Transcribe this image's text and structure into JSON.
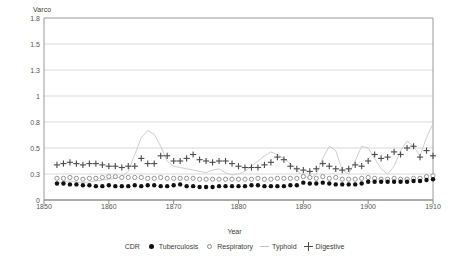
{
  "chart_data": {
    "type": "scatter",
    "title": "",
    "ylabel": "Varco",
    "xlabel": "Year",
    "xlim": [
      1850,
      1910
    ],
    "ylim": [
      0,
      1.8
    ],
    "grid": true,
    "legend_position": "bottom",
    "ytick_labels": [
      "1.8",
      "1.5",
      "1.3",
      "1",
      "0.8",
      "0.5",
      "0.3",
      "0"
    ],
    "ytick_values": [
      1.8,
      1.5,
      1.3,
      1.0,
      0.8,
      0.5,
      0.3,
      0.0
    ],
    "xtick_labels": [
      "1850",
      "1860",
      "1870",
      "1880",
      "1890",
      "1900",
      "1910"
    ],
    "xtick_values": [
      1850,
      1860,
      1870,
      1880,
      1890,
      1900,
      1910
    ],
    "legend_prefix": "CDR",
    "series": [
      {
        "name": "Tuberculosis",
        "marker": "filled-circle",
        "color": "#111111",
        "x": [
          1852,
          1853,
          1854,
          1855,
          1856,
          1857,
          1858,
          1859,
          1860,
          1861,
          1862,
          1863,
          1864,
          1865,
          1866,
          1867,
          1868,
          1869,
          1870,
          1871,
          1872,
          1873,
          1874,
          1875,
          1876,
          1877,
          1878,
          1879,
          1880,
          1881,
          1882,
          1883,
          1884,
          1885,
          1886,
          1887,
          1888,
          1889,
          1890,
          1891,
          1892,
          1893,
          1894,
          1895,
          1896,
          1897,
          1898,
          1899,
          1900,
          1901,
          1902,
          1903,
          1904,
          1905,
          1906,
          1907,
          1908,
          1909,
          1910
        ],
        "values": [
          0.19,
          0.19,
          0.18,
          0.18,
          0.17,
          0.17,
          0.16,
          0.16,
          0.17,
          0.16,
          0.16,
          0.16,
          0.17,
          0.16,
          0.17,
          0.17,
          0.16,
          0.16,
          0.17,
          0.18,
          0.16,
          0.16,
          0.15,
          0.15,
          0.15,
          0.16,
          0.16,
          0.16,
          0.16,
          0.16,
          0.17,
          0.17,
          0.16,
          0.16,
          0.16,
          0.16,
          0.17,
          0.17,
          0.2,
          0.19,
          0.19,
          0.2,
          0.19,
          0.18,
          0.18,
          0.18,
          0.18,
          0.19,
          0.21,
          0.21,
          0.21,
          0.21,
          0.21,
          0.21,
          0.21,
          0.22,
          0.22,
          0.23,
          0.24
        ]
      },
      {
        "name": "Respiratory",
        "marker": "open-circle",
        "color": "#8a8a8a",
        "x": [
          1852,
          1853,
          1854,
          1855,
          1856,
          1857,
          1858,
          1859,
          1860,
          1861,
          1862,
          1863,
          1864,
          1865,
          1866,
          1867,
          1868,
          1869,
          1870,
          1871,
          1872,
          1873,
          1874,
          1875,
          1876,
          1877,
          1878,
          1879,
          1880,
          1881,
          1882,
          1883,
          1884,
          1885,
          1886,
          1887,
          1888,
          1889,
          1890,
          1891,
          1892,
          1893,
          1894,
          1895,
          1896,
          1897,
          1898,
          1899,
          1900,
          1901,
          1902,
          1903,
          1904,
          1905,
          1906,
          1907,
          1908,
          1909,
          1910
        ],
        "values": [
          0.25,
          0.25,
          0.26,
          0.25,
          0.24,
          0.25,
          0.25,
          0.26,
          0.27,
          0.27,
          0.26,
          0.26,
          0.26,
          0.26,
          0.25,
          0.25,
          0.26,
          0.25,
          0.25,
          0.25,
          0.25,
          0.25,
          0.24,
          0.24,
          0.24,
          0.24,
          0.24,
          0.24,
          0.24,
          0.24,
          0.24,
          0.25,
          0.24,
          0.24,
          0.25,
          0.25,
          0.25,
          0.25,
          0.27,
          0.26,
          0.25,
          0.27,
          0.25,
          0.26,
          0.24,
          0.24,
          0.24,
          0.25,
          0.26,
          0.25,
          0.24,
          0.24,
          0.25,
          0.24,
          0.24,
          0.25,
          0.25,
          0.27,
          0.28
        ]
      },
      {
        "name": "Typhoid",
        "marker": "line",
        "color": "#c8c8c8",
        "x": [
          1852,
          1853,
          1854,
          1855,
          1856,
          1857,
          1858,
          1859,
          1860,
          1861,
          1862,
          1863,
          1864,
          1865,
          1866,
          1867,
          1868,
          1869,
          1870,
          1871,
          1872,
          1873,
          1874,
          1875,
          1876,
          1877,
          1878,
          1879,
          1880,
          1881,
          1882,
          1883,
          1884,
          1885,
          1886,
          1887,
          1888,
          1889,
          1890,
          1891,
          1892,
          1893,
          1894,
          1895,
          1896,
          1897,
          1898,
          1899,
          1900,
          1901,
          1902,
          1903,
          1904,
          1905,
          1906,
          1907,
          1908,
          1909,
          1910
        ],
        "values": [
          0.2,
          0.21,
          0.22,
          0.21,
          0.2,
          0.21,
          0.22,
          0.23,
          0.24,
          0.25,
          0.27,
          0.32,
          0.45,
          0.62,
          0.7,
          0.66,
          0.52,
          0.4,
          0.36,
          0.35,
          0.34,
          0.33,
          0.32,
          0.31,
          0.33,
          0.34,
          0.31,
          0.29,
          0.3,
          0.32,
          0.36,
          0.4,
          0.44,
          0.47,
          0.45,
          0.42,
          0.38,
          0.33,
          0.28,
          0.25,
          0.3,
          0.42,
          0.52,
          0.48,
          0.33,
          0.3,
          0.4,
          0.52,
          0.5,
          0.42,
          0.34,
          0.3,
          0.36,
          0.48,
          0.58,
          0.52,
          0.44,
          0.62,
          0.78
        ]
      },
      {
        "name": "Digestive",
        "marker": "plus",
        "color": "#4a4a4a",
        "x": [
          1852,
          1853,
          1854,
          1855,
          1856,
          1857,
          1858,
          1859,
          1860,
          1861,
          1862,
          1863,
          1864,
          1865,
          1866,
          1867,
          1868,
          1869,
          1870,
          1871,
          1872,
          1873,
          1874,
          1875,
          1876,
          1877,
          1878,
          1879,
          1880,
          1881,
          1882,
          1883,
          1884,
          1885,
          1886,
          1887,
          1888,
          1889,
          1890,
          1891,
          1892,
          1893,
          1894,
          1895,
          1896,
          1897,
          1898,
          1899,
          1900,
          1901,
          1902,
          1903,
          1904,
          1905,
          1906,
          1907,
          1908,
          1909,
          1910
        ],
        "values": [
          0.37,
          0.38,
          0.39,
          0.38,
          0.37,
          0.38,
          0.38,
          0.37,
          0.36,
          0.36,
          0.35,
          0.36,
          0.36,
          0.42,
          0.38,
          0.38,
          0.44,
          0.44,
          0.4,
          0.4,
          0.42,
          0.45,
          0.41,
          0.4,
          0.39,
          0.4,
          0.4,
          0.38,
          0.36,
          0.35,
          0.35,
          0.35,
          0.37,
          0.39,
          0.43,
          0.41,
          0.36,
          0.34,
          0.33,
          0.32,
          0.34,
          0.38,
          0.36,
          0.34,
          0.33,
          0.34,
          0.37,
          0.36,
          0.4,
          0.45,
          0.42,
          0.43,
          0.47,
          0.45,
          0.5,
          0.52,
          0.43,
          0.48,
          0.44
        ]
      }
    ]
  }
}
